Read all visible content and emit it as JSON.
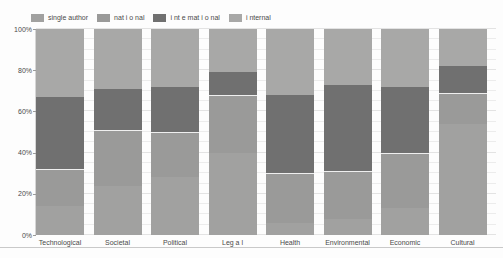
{
  "figure": {
    "kind": "100% stacked bar chart",
    "background_color": "#fdfdfd"
  },
  "legend": {
    "items": [
      {
        "label": "single author",
        "color": "#a1a1a0"
      },
      {
        "label": "nat i o nal",
        "color": "#9a9a99"
      },
      {
        "label": "i nt e mat i o nal",
        "color": "#707070"
      },
      {
        "label": "i nternal",
        "color": "#a8a8a7"
      }
    ]
  },
  "y_axis": {
    "tick_labels": [
      "0%",
      "20%",
      "40%",
      "60%",
      "80%",
      "100%"
    ],
    "tick_values": [
      0,
      20,
      40,
      60,
      80,
      100
    ],
    "minor_grid_step": 5
  },
  "chart_data": {
    "type": "bar",
    "subtype": "stacked-100-percent",
    "title": "",
    "xlabel": "",
    "ylabel": "",
    "ylim": [
      0,
      100
    ],
    "grid": true,
    "legend_position": "top-left",
    "categories": [
      "Technological",
      "Societal",
      "Political",
      "Leg a l",
      "Health",
      "Environmental",
      "Economic",
      "Cultural"
    ],
    "series": [
      {
        "name": "single author",
        "color": "#a1a1a0",
        "values": [
          14,
          24,
          28,
          40,
          6,
          8,
          13,
          54
        ]
      },
      {
        "name": "nat i o nal",
        "color": "#9a9a99",
        "values": [
          18,
          27,
          22,
          28,
          24,
          23,
          27,
          15
        ]
      },
      {
        "name": "i nt e mat i o nal",
        "color": "#707070",
        "values": [
          35,
          20,
          22,
          11,
          38,
          42,
          32,
          13
        ]
      },
      {
        "name": "i nternal",
        "color": "#a8a8a7",
        "values": [
          33,
          29,
          28,
          21,
          32,
          27,
          28,
          18
        ]
      }
    ]
  },
  "layout_colors": {
    "gridline": "#ececec",
    "gridline_major": "#e3e3e3",
    "axis_text": "#4a4a4a",
    "segment_divider": "#efefef",
    "bottom_rule": "#c9c9c9"
  }
}
